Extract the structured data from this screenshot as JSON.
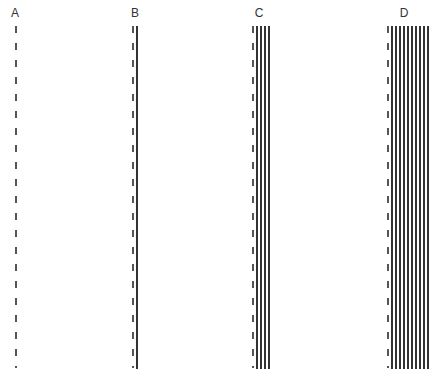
{
  "panels": [
    {
      "label": "A",
      "dashed_x": 15,
      "solid_lines": []
    },
    {
      "label": "B",
      "dashed_x": 132,
      "solid_lines": [
        136
      ]
    },
    {
      "label": "C",
      "dashed_x": 252,
      "solid_lines": [
        256,
        260,
        264,
        268
      ]
    },
    {
      "label": "D",
      "dashed_x": 387,
      "solid_lines": [
        391,
        395,
        399,
        403,
        407,
        411,
        415,
        419,
        423,
        427
      ]
    }
  ],
  "colors": {
    "line": "#333333",
    "dash": "#555555",
    "background": "#ffffff"
  }
}
